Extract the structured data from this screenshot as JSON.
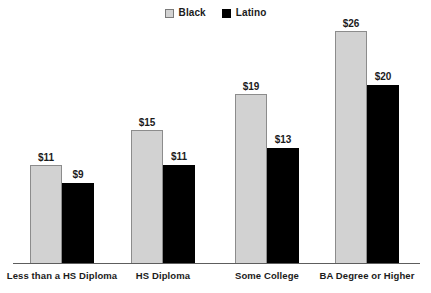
{
  "legend": {
    "position": "top-center",
    "entries": [
      {
        "label": "Black",
        "swatch": "light-gray-square",
        "color": "#d2d2d2"
      },
      {
        "label": "Latino",
        "swatch": "black-square",
        "color": "#000000"
      }
    ]
  },
  "chart_data": {
    "type": "bar",
    "title": "",
    "subtitle": "",
    "xlabel": "",
    "ylabel": "",
    "grid": false,
    "legend_position": "top-center",
    "axis": {
      "baseline_visible": true,
      "y_axis_visible": false,
      "y_ticks": []
    },
    "ylim": [
      0,
      26.5
    ],
    "value_prefix": "$",
    "categories": [
      "Less than a HS Diploma",
      "HS Diploma",
      "Some College",
      "BA Degree or Higher"
    ],
    "series": [
      {
        "name": "Black",
        "color": "#d2d2d2",
        "values": [
          11,
          15,
          19,
          26
        ],
        "labels": [
          "$11",
          "$15",
          "$19",
          "$26"
        ]
      },
      {
        "name": "Latino",
        "color": "#000000",
        "values": [
          9,
          11,
          13,
          20
        ],
        "labels": [
          "$9",
          "$11",
          "$13",
          "$20"
        ]
      }
    ]
  },
  "geometry": {
    "plot_left": 13,
    "plot_right": 420,
    "baseline_y": 263,
    "bar_width": 32,
    "group_centers": [
      62,
      163,
      267,
      367
    ],
    "px_per_unit": 8.96
  }
}
